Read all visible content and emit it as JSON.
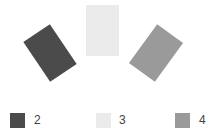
{
  "cards": [
    {
      "id": "2",
      "color": "#4b4b4b",
      "cx": 49.5,
      "cy": 53,
      "w": 32,
      "h": 48,
      "rotate": -34
    },
    {
      "id": "3",
      "color": "#ebebeb",
      "cx": 102.5,
      "cy": 30.5,
      "w": 33,
      "h": 51,
      "rotate": 0
    },
    {
      "id": "4",
      "color": "#9a9a9a",
      "cx": 155.5,
      "cy": 52.5,
      "w": 32,
      "h": 48,
      "rotate": 36
    }
  ],
  "legend": [
    {
      "label": "2",
      "color": "#4b4b4b",
      "swatch_x": 10,
      "label_x": 34
    },
    {
      "label": "3",
      "color": "#ebebeb",
      "swatch_x": 96,
      "label_x": 119
    },
    {
      "label": "4",
      "color": "#9a9a9a",
      "swatch_x": 175,
      "label_x": 199
    }
  ]
}
